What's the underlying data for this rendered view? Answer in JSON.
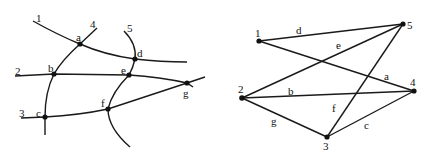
{
  "left_diagram": {
    "description": "Map of five curves (1-5) with seven intersection points (a-g)",
    "curve_labels": {
      "c1": "1",
      "c2": "2",
      "c3": "3",
      "c4": "4",
      "c5": "5"
    },
    "point_labels": {
      "a": "a",
      "b": "b",
      "c": "c",
      "d": "d",
      "e": "e",
      "f": "f",
      "g": "g"
    }
  },
  "right_diagram": {
    "description": "Graph with vertices 1-5 and edges a-g",
    "vertex_labels": {
      "v1": "1",
      "v2": "2",
      "v3": "3",
      "v4": "4",
      "v5": "5"
    },
    "edge_labels": {
      "a": "a",
      "b": "b",
      "c": "c",
      "d": "d",
      "e": "e",
      "f": "f",
      "g": "g"
    },
    "edges": [
      {
        "label": "a",
        "from": "1",
        "to": "4"
      },
      {
        "label": "b",
        "from": "2",
        "to": "4"
      },
      {
        "label": "c",
        "from": "3",
        "to": "4"
      },
      {
        "label": "d",
        "from": "1",
        "to": "5"
      },
      {
        "label": "e",
        "from": "2",
        "to": "5"
      },
      {
        "label": "f",
        "from": "3",
        "to": "5"
      },
      {
        "label": "g",
        "from": "2",
        "to": "3"
      }
    ]
  },
  "colors": {
    "stroke": "#1a1a1a",
    "node": "#111111",
    "background": "#ffffff"
  }
}
